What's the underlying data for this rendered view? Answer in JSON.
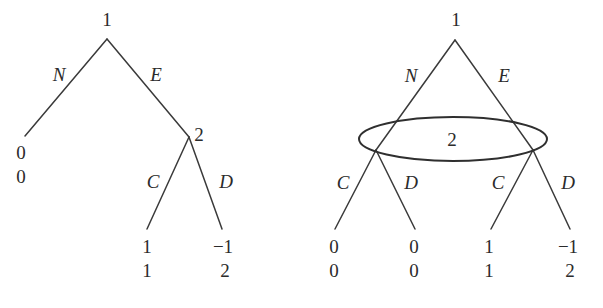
{
  "figure": {
    "ink_color": "#3a3a3a",
    "background_color": "#ffffff"
  },
  "left_tree": {
    "name": "perfect-information-tree",
    "root_player_label": "1",
    "decision_node_label": "2",
    "actions": {
      "root_left": "N",
      "root_right": "E",
      "node2_left": "C",
      "node2_right": "D"
    },
    "payoffs": [
      {
        "id": "N-outcome",
        "top": "0",
        "bottom": "0"
      },
      {
        "id": "EC-outcome",
        "top": "1",
        "bottom": "1"
      },
      {
        "id": "ED-outcome",
        "top": "−1",
        "bottom": "2"
      }
    ]
  },
  "right_tree": {
    "name": "imperfect-information-tree",
    "root_player_label": "1",
    "information_set_label": "2",
    "actions": {
      "root_left": "N",
      "root_right": "E",
      "left_node_left": "C",
      "left_node_right": "D",
      "right_node_left": "C",
      "right_node_right": "D"
    },
    "payoffs": [
      {
        "id": "NC-outcome",
        "top": "0",
        "bottom": "0"
      },
      {
        "id": "ND-outcome",
        "top": "0",
        "bottom": "0"
      },
      {
        "id": "EC-outcome",
        "top": "1",
        "bottom": "1"
      },
      {
        "id": "ED-outcome",
        "top": "−1",
        "bottom": "2"
      }
    ]
  }
}
